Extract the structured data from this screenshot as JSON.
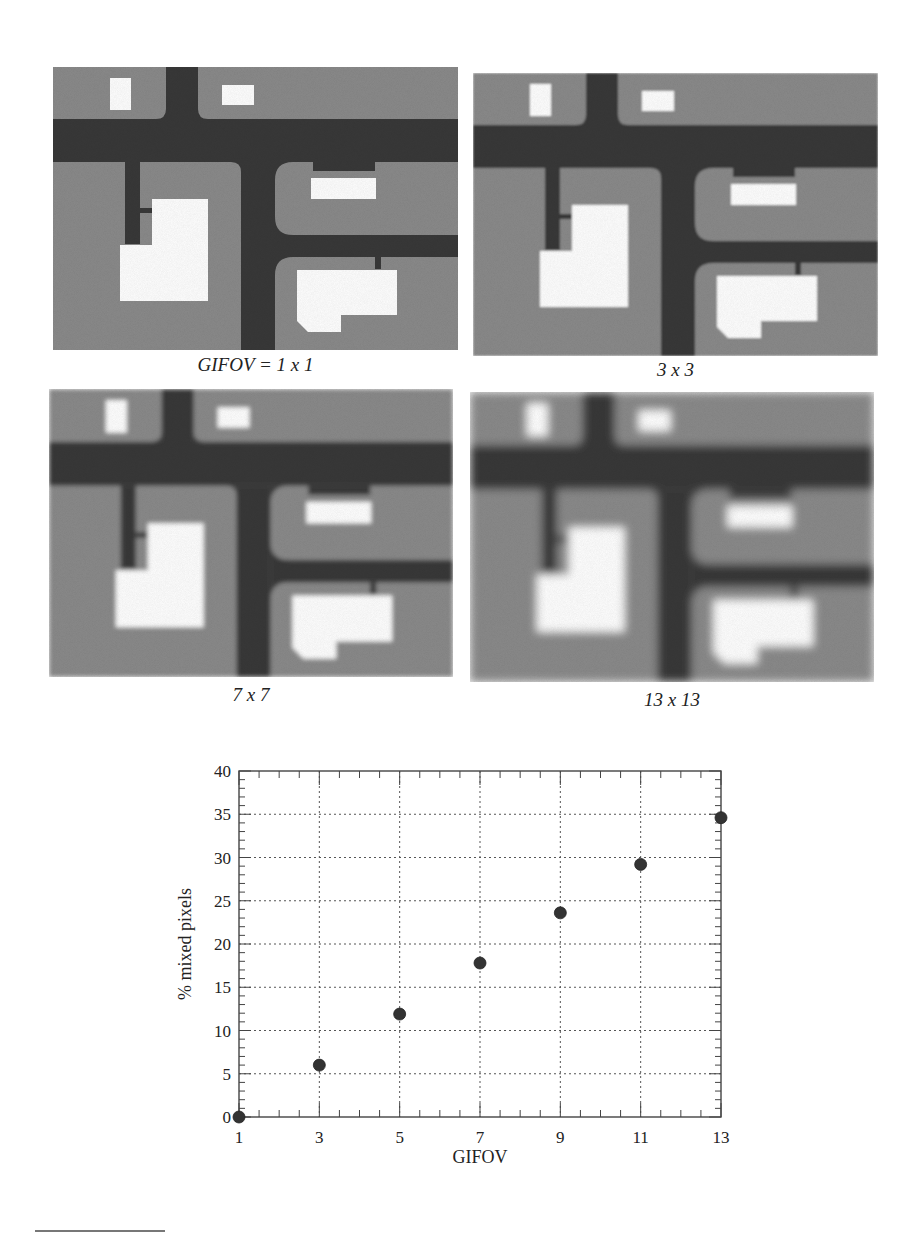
{
  "figure": {
    "panels": [
      {
        "id": "p1",
        "caption": "GIFOV = 1 x 1",
        "blur": 0,
        "x": 53,
        "y": 67,
        "w": 405,
        "h": 283,
        "cap_x": 53,
        "cap_y": 354,
        "cap_w": 405
      },
      {
        "id": "p2",
        "caption": "3 x 3",
        "blur": 0.9,
        "x": 473,
        "y": 73,
        "w": 405,
        "h": 283,
        "cap_x": 473,
        "cap_y": 359,
        "cap_w": 405
      },
      {
        "id": "p3",
        "caption": "7 x 7",
        "blur": 2.2,
        "x": 49,
        "y": 389,
        "w": 404,
        "h": 288,
        "cap_x": 49,
        "cap_y": 684,
        "cap_w": 404
      },
      {
        "id": "p4",
        "caption": "13 x 13",
        "blur": 4.2,
        "x": 470,
        "y": 392,
        "w": 404,
        "h": 290,
        "cap_x": 470,
        "cap_y": 689,
        "cap_w": 404
      }
    ],
    "colors": {
      "road": "#383838",
      "block": "#8a8a8a",
      "building": "#ffffff"
    }
  },
  "chart_data": {
    "type": "scatter",
    "title": "",
    "xlabel": "GIFOV",
    "ylabel": "% mixed pixels",
    "x": [
      1,
      3,
      5,
      7,
      9,
      11,
      13
    ],
    "y": [
      0,
      6.0,
      11.9,
      17.8,
      23.6,
      29.2,
      34.6
    ],
    "xlim": [
      1,
      13
    ],
    "ylim": [
      0,
      40
    ],
    "xticks": [
      1,
      3,
      5,
      7,
      9,
      11,
      13
    ],
    "yticks": [
      0,
      5,
      10,
      15,
      20,
      25,
      30,
      35,
      40
    ],
    "grid": true,
    "grid_style": "dotted",
    "marker": "filled-circle",
    "marker_color": "#333333",
    "legend": null
  }
}
